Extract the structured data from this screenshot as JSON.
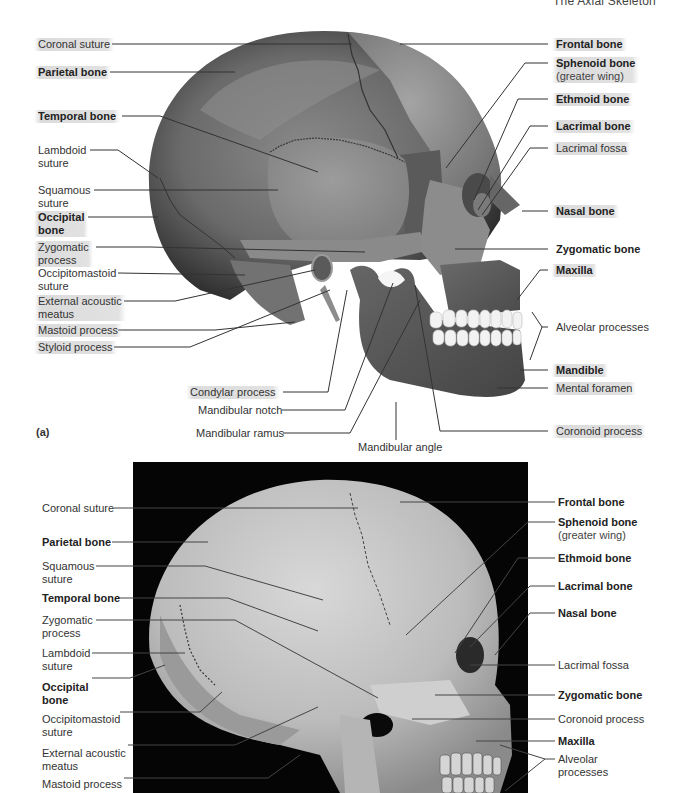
{
  "header": {
    "running_title": "The Axial Skeleton",
    "page_number": "1"
  },
  "figure_a": {
    "letter": "(a)",
    "style": "illustration",
    "left_labels": [
      {
        "text": "Coronal suture",
        "bold": false
      },
      {
        "text": "Parietal bone",
        "bold": true
      },
      {
        "text": "Temporal bone",
        "bold": true
      },
      {
        "text": "Lambdoid",
        "text2": "suture",
        "bold": false
      },
      {
        "text": "Squamous",
        "text2": "suture",
        "bold": false
      },
      {
        "text": "Occipital",
        "text2": "bone",
        "bold": true
      },
      {
        "text": "Zygomatic",
        "text2": "process",
        "bold": false
      },
      {
        "text": "Occipitomastoid",
        "text2": "suture",
        "bold": false
      },
      {
        "text": "External acoustic",
        "text2": "meatus",
        "bold": false
      },
      {
        "text": "Mastoid process",
        "bold": false
      },
      {
        "text": "Styloid process",
        "bold": false
      }
    ],
    "center_labels": [
      {
        "text": "Condylar process",
        "bold": false
      },
      {
        "text": "Mandibular notch",
        "bold": false
      },
      {
        "text": "Mandibular ramus",
        "bold": false
      },
      {
        "text": "Mandibular angle",
        "bold": false
      }
    ],
    "right_labels": [
      {
        "text": "Frontal bone",
        "bold": true
      },
      {
        "text": "Sphenoid bone",
        "sub": "(greater wing)",
        "bold": true
      },
      {
        "text": "Ethmoid bone",
        "bold": true
      },
      {
        "text": "Lacrimal bone",
        "bold": true
      },
      {
        "text": "Lacrimal fossa",
        "bold": false
      },
      {
        "text": "Nasal bone",
        "bold": true
      },
      {
        "text": "Zygomatic bone",
        "bold": true
      },
      {
        "text": "Maxilla",
        "bold": true
      },
      {
        "text": "Alveolar processes",
        "bold": false
      },
      {
        "text": "Mandible",
        "bold": true
      },
      {
        "text": "Mental foramen",
        "bold": false
      },
      {
        "text": "Coronoid process",
        "bold": false
      }
    ]
  },
  "figure_b": {
    "style": "photograph",
    "left_labels": [
      {
        "text": "Coronal suture",
        "bold": false
      },
      {
        "text": "Parietal bone",
        "bold": true
      },
      {
        "text": "Squamous",
        "text2": "suture",
        "bold": false
      },
      {
        "text": "Temporal bone",
        "bold": true
      },
      {
        "text": "Zygomatic",
        "text2": "process",
        "bold": false
      },
      {
        "text": "Lambdoid",
        "text2": "suture",
        "bold": false
      },
      {
        "text": "Occipital",
        "text2": "bone",
        "bold": true
      },
      {
        "text": "Occipitomastoid",
        "text2": "suture",
        "bold": false
      },
      {
        "text": "External acoustic",
        "text2": "meatus",
        "bold": false
      },
      {
        "text": "Mastoid process",
        "bold": false
      }
    ],
    "right_labels": [
      {
        "text": "Frontal bone",
        "bold": true
      },
      {
        "text": "Sphenoid bone",
        "sub": "(greater wing)",
        "bold": true
      },
      {
        "text": "Ethmoid bone",
        "bold": true
      },
      {
        "text": "Lacrimal bone",
        "bold": true
      },
      {
        "text": "Nasal bone",
        "bold": true
      },
      {
        "text": "Lacrimal fossa",
        "bold": false
      },
      {
        "text": "Zygomatic bone",
        "bold": true
      },
      {
        "text": "Coronoid process",
        "bold": false
      },
      {
        "text": "Maxilla",
        "bold": true
      },
      {
        "text": "Alveolar",
        "text2": "processes",
        "bold": false
      }
    ]
  }
}
